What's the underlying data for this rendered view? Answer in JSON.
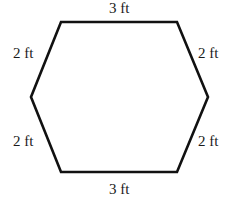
{
  "diagram": {
    "shape": "hexagon",
    "stroke_color": "#111111",
    "background_color": "#ffffff",
    "vertices": [
      {
        "name": "top-left",
        "x": 61,
        "y": 22
      },
      {
        "name": "top-right",
        "x": 177,
        "y": 22
      },
      {
        "name": "right",
        "x": 208,
        "y": 97
      },
      {
        "name": "bottom-right",
        "x": 177,
        "y": 172
      },
      {
        "name": "bottom-left",
        "x": 61,
        "y": 172
      },
      {
        "name": "left",
        "x": 31,
        "y": 97
      }
    ],
    "sides": {
      "top": "3 ft",
      "upper_right": "2 ft",
      "lower_right": "2 ft",
      "bottom": "3 ft",
      "lower_left": "2 ft",
      "upper_left": "2 ft"
    }
  }
}
